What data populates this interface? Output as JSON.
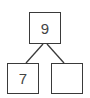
{
  "diagram": {
    "type": "number-bond",
    "whole": "9",
    "parts": [
      {
        "value": "7"
      },
      {
        "value": ""
      }
    ],
    "line_color": "#3a3a3a",
    "text_color": "#444444"
  }
}
